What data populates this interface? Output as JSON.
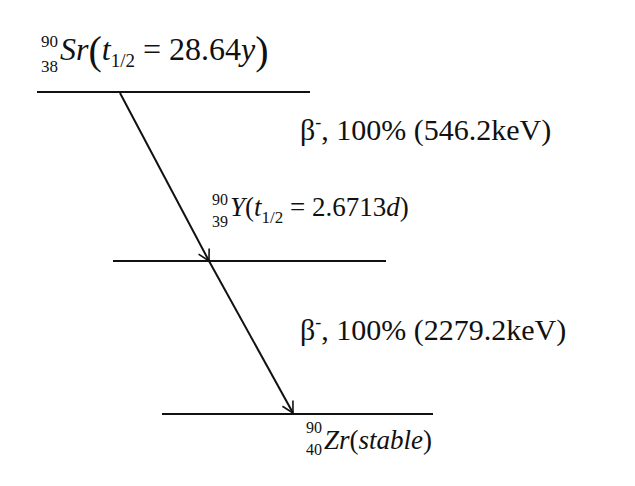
{
  "diagram": {
    "type": "decay-scheme",
    "levels": [
      {
        "id": "sr90",
        "mass": "90",
        "z": "38",
        "symbol": "Sr",
        "half_life_label": "t",
        "half_life_sub": "1/2",
        "half_life_value": "28.64",
        "half_life_unit": "y",
        "line": {
          "x1": 37,
          "x2": 310,
          "y": 92
        }
      },
      {
        "id": "y90",
        "mass": "90",
        "z": "39",
        "symbol": "Y",
        "half_life_label": "t",
        "half_life_sub": "1/2",
        "half_life_value": "2.6713",
        "half_life_unit": "d",
        "line": {
          "x1": 113,
          "x2": 386,
          "y": 261
        }
      },
      {
        "id": "zr90",
        "mass": "90",
        "z": "40",
        "symbol": "Zr",
        "state": "stable",
        "line": {
          "x1": 162,
          "x2": 433,
          "y": 414
        }
      }
    ],
    "transitions": [
      {
        "from": "sr90",
        "to": "y90",
        "particle": "β",
        "charge": "-",
        "branching": "100%",
        "energy": "546.2keV",
        "label_suffix": ", 100% (546.2keV)"
      },
      {
        "from": "y90",
        "to": "zr90",
        "particle": "β",
        "charge": "-",
        "branching": "100%",
        "energy": "2279.2keV",
        "label_suffix": ", 100% (2279.2keV)"
      }
    ],
    "arrow": {
      "start": [
        120,
        92
      ],
      "mid": [
        209,
        261
      ],
      "end": [
        293,
        414
      ],
      "color": "#111111"
    }
  }
}
